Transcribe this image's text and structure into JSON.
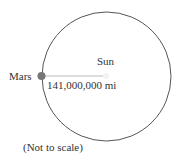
{
  "diagram": {
    "sun_label": "Sun",
    "mars_label": "Mars",
    "distance_label": "141,000,000 mi",
    "note": "(Not to scale)",
    "colors": {
      "orbit": "#555555",
      "mars": "#777777",
      "radius_line": "#bbbbbb",
      "text": "#333333"
    }
  }
}
